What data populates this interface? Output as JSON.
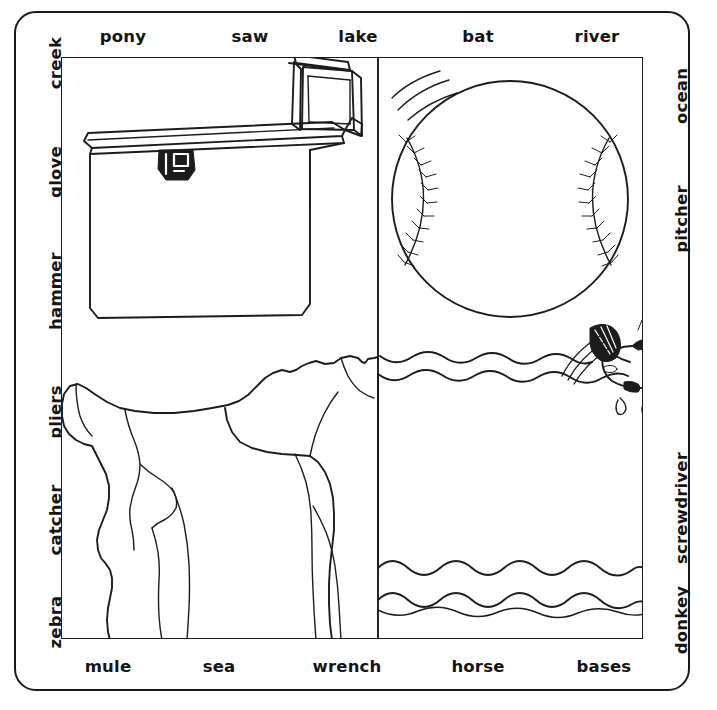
{
  "puzzle": {
    "background_color": "#ffffff",
    "ink_color": "#1c1c1c",
    "border_style": "rounded-rectangle"
  },
  "labels": {
    "top": [
      {
        "text": "pony",
        "x": 123
      },
      {
        "text": "saw",
        "x": 250
      },
      {
        "text": "lake",
        "x": 358
      },
      {
        "text": "bat",
        "x": 478
      },
      {
        "text": "river",
        "x": 597
      }
    ],
    "bottom": [
      {
        "text": "mule",
        "x": 108
      },
      {
        "text": "sea",
        "x": 219
      },
      {
        "text": "wrench",
        "x": 347
      },
      {
        "text": "horse",
        "x": 478
      },
      {
        "text": "bases",
        "x": 604
      }
    ],
    "left": [
      {
        "text": "creek",
        "y": 63
      },
      {
        "text": "glove",
        "y": 172
      },
      {
        "text": "hammer",
        "y": 291
      },
      {
        "text": "pliers",
        "y": 412
      },
      {
        "text": "catcher",
        "y": 520
      },
      {
        "text": "zebra",
        "y": 622
      }
    ],
    "right": [
      {
        "text": "ocean",
        "y": 96
      },
      {
        "text": "pitcher",
        "y": 219
      },
      {
        "text": "screwdriver",
        "y": 508
      },
      {
        "text": "donkey",
        "y": 620
      }
    ]
  },
  "artwork": {
    "quadrants": [
      {
        "name": "toolbox",
        "position": "top-left",
        "description": "open tool chest with lid and latch"
      },
      {
        "name": "baseball",
        "position": "top-right",
        "description": "baseball with stitching and motion lines"
      },
      {
        "name": "horse",
        "position": "bottom-left",
        "description": "horse silhouette outline"
      },
      {
        "name": "water",
        "position": "bottom-right",
        "description": "wavy water surface with leaping fish"
      }
    ]
  }
}
